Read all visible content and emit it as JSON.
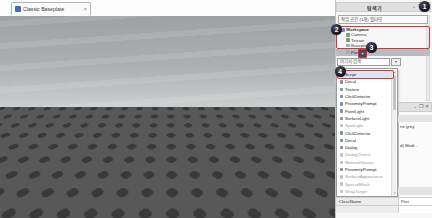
{
  "tab_bar": {
    "tab_label": "Classic Baseplate",
    "tab_close": "×"
  },
  "explorer": {
    "title": "탐색기",
    "window_controls": {
      "collapse": "⌄",
      "float": "❐",
      "close": "✕"
    },
    "filter_text": "작업 공간 (1개) 필터링",
    "expand_arrow": "▾",
    "tree": {
      "items": [
        {
          "label": "Workspace",
          "icon": "workspace-icon"
        },
        {
          "label": "Camera",
          "icon": "camera-icon"
        },
        {
          "label": "Terrain",
          "icon": "terrain-icon"
        },
        {
          "label": "Baseplate",
          "icon": "part-icon"
        },
        {
          "label": "Part",
          "icon": "part-icon",
          "selected": true
        }
      ]
    },
    "insert_plus": "+"
  },
  "insert_widget": {
    "search_text": "여기서 검색",
    "menu_button": "▾",
    "scroll_up": "▴",
    "scroll_down": "▾",
    "items": [
      {
        "label": "Script",
        "selected": true
      },
      {
        "label": "Decal"
      },
      {
        "label": "Texture"
      },
      {
        "label": "ClickDetector"
      },
      {
        "label": "ProximityPrompt"
      },
      {
        "label": "PointLight"
      },
      {
        "label": "SurfaceLight"
      },
      {
        "label": "SpotLight",
        "muted": true
      },
      {
        "label": "ClickDetector"
      },
      {
        "label": "Decal"
      },
      {
        "label": "Dialog"
      },
      {
        "label": "DialogChoice",
        "muted": true
      },
      {
        "label": "MaterialVariant",
        "muted": true
      },
      {
        "label": "ProximityPrompt"
      },
      {
        "label": "SurfaceAppearance",
        "muted": true
      },
      {
        "label": "SpecialMesh",
        "muted": true
      },
      {
        "label": "WrapTarget",
        "muted": true
      }
    ]
  },
  "properties": {
    "window_controls": {
      "collapse": "⌄",
      "float": "❐",
      "close": "✕"
    },
    "fragment_1": "ne grey",
    "fragment_2": "d) Medi...",
    "table": [
      {
        "name": "ClassName",
        "value": "Part"
      },
      {
        "name": "",
        "value": ""
      }
    ]
  },
  "annotations": {
    "accent_color": "#e03131",
    "circles": [
      {
        "number": "1"
      },
      {
        "number": "2"
      },
      {
        "number": "3"
      },
      {
        "number": "4"
      }
    ]
  },
  "colors": {
    "sky_top": "#9ea2a4",
    "sky_horizon": "#cdd0d0",
    "ground": "#585858",
    "stud": "#393939",
    "part_top": "#d2d3d4",
    "part_front": "#bcbdbf",
    "part_side": "#a4a5a7",
    "selection_row": "#b9bcc0",
    "script_selection": "#d8e7f8"
  }
}
